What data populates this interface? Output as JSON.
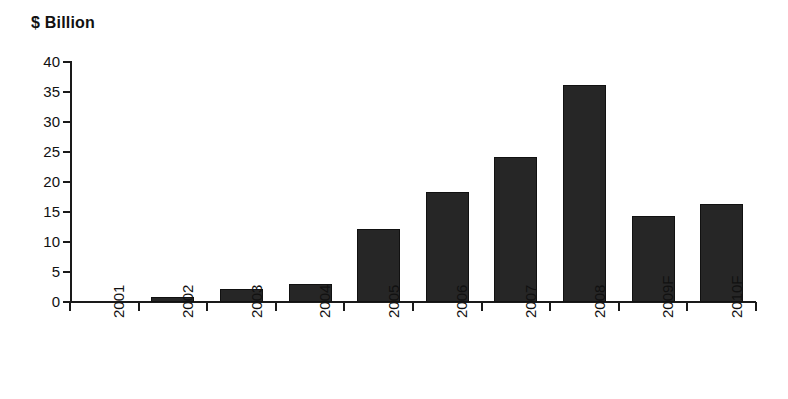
{
  "chart_data": {
    "type": "bar",
    "title": "$ Billion",
    "xlabel": "",
    "ylabel": "$ Billion",
    "categories": [
      "2001",
      "2002",
      "2003",
      "2004",
      "2005",
      "2006",
      "2007",
      "2008",
      "2009F",
      "2010F"
    ],
    "values": [
      0,
      0.9,
      2.2,
      3.0,
      12.2,
      18.4,
      24.2,
      36.2,
      14.3,
      16.4
    ],
    "ylim": [
      0,
      40
    ],
    "ytick_labels": [
      "40",
      "35",
      "30",
      "25",
      "20",
      "15",
      "10",
      "5",
      "0"
    ],
    "ytick_values": [
      40,
      35,
      30,
      25,
      20,
      15,
      10,
      5,
      0
    ],
    "grid": false,
    "legend": null,
    "bar_color": "#262626",
    "axis_color": "#1a1a1a",
    "background": "#ffffff"
  }
}
